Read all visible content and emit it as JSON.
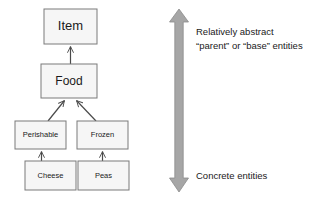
{
  "diagram": {
    "colors": {
      "box_fill": "#f6f6f6",
      "box_stroke": "#7a7a7a",
      "connector": "#4a4a4a",
      "arrow_fill": "#a6a6a6",
      "arrow_stroke": "#8c8c8c",
      "text": "#1a1a1a",
      "background": "#ffffff"
    },
    "nodes": [
      {
        "id": "item",
        "label": "Item",
        "level": "root",
        "x": 44,
        "y": 9,
        "w": 53,
        "h": 35,
        "font_size": 13
      },
      {
        "id": "food",
        "label": "Food",
        "level": "1",
        "x": 41,
        "y": 64,
        "w": 56,
        "h": 34,
        "font_size": 12
      },
      {
        "id": "perishable",
        "label": "Perishable",
        "level": "2",
        "x": 15,
        "y": 121,
        "w": 51,
        "h": 28,
        "font_size": 7.5
      },
      {
        "id": "frozen",
        "label": "Frozen",
        "level": "2",
        "x": 77,
        "y": 121,
        "w": 51,
        "h": 28,
        "font_size": 7.5
      },
      {
        "id": "cheese",
        "label": "Cheese",
        "level": "3",
        "x": 25,
        "y": 161,
        "w": 51,
        "h": 29,
        "font_size": 7.5
      },
      {
        "id": "peas",
        "label": "Peas",
        "level": "3",
        "x": 78,
        "y": 161,
        "w": 51,
        "h": 29,
        "font_size": 7.5
      }
    ],
    "edges": [
      {
        "from": "food",
        "to": "item",
        "kind": "generalization"
      },
      {
        "from": "perishable",
        "to": "food",
        "kind": "generalization"
      },
      {
        "from": "frozen",
        "to": "food",
        "kind": "generalization"
      },
      {
        "from": "cheese",
        "to": "perishable",
        "kind": "generalization"
      },
      {
        "from": "peas",
        "to": "frozen",
        "kind": "generalization"
      }
    ],
    "axis": {
      "name": "abstraction-axis",
      "orientation": "vertical",
      "double_headed": true,
      "top_label_line1": "Relatively abstract",
      "top_label_line2": "“parent” or “base” entities",
      "bottom_label": "Concrete entities"
    }
  }
}
